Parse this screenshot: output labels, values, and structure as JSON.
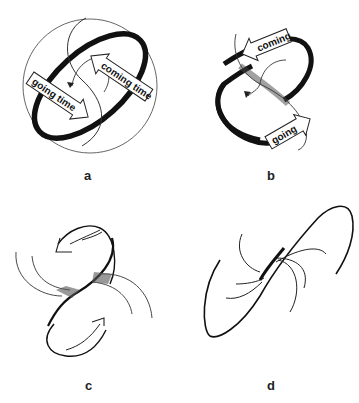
{
  "figure": {
    "panels": [
      {
        "id": "a",
        "label": "a",
        "arrows": [
          {
            "text": "going time"
          },
          {
            "text": "coming time"
          }
        ]
      },
      {
        "id": "b",
        "label": "b",
        "arrows": [
          {
            "text": "coming"
          },
          {
            "text": "going"
          }
        ]
      },
      {
        "id": "c",
        "label": "c"
      },
      {
        "id": "d",
        "label": "d"
      }
    ]
  },
  "colors": {
    "ink": "#111111",
    "background": "#ffffff"
  }
}
